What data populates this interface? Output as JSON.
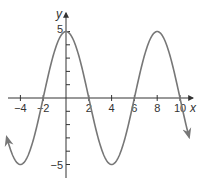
{
  "chart_data": {
    "type": "line",
    "title": "",
    "xlabel": "x",
    "ylabel": "y",
    "function": "y = 5cos(pi*x/4)",
    "xlim": [
      -5.3,
      11.2
    ],
    "ylim": [
      -5.6,
      5.6
    ],
    "grid": false,
    "x_ticks": [
      -4,
      -2,
      2,
      4,
      6,
      8,
      10
    ],
    "x_tick_labels": [
      "−4",
      "−2",
      "2",
      "4",
      "6",
      "8",
      "10"
    ],
    "y_tick_labels": [
      "5",
      "−5"
    ],
    "series": [
      {
        "name": "curve",
        "color": "#777777",
        "x": [
          -5.2,
          -4,
          -2,
          0,
          2,
          4,
          6,
          8,
          10,
          10.8
        ],
        "values": [
          -4.6,
          -5,
          0,
          5,
          0,
          -5,
          0,
          5,
          0,
          -3.1
        ]
      }
    ]
  }
}
